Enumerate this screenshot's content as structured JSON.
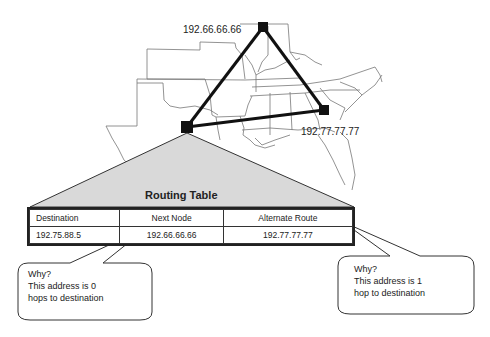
{
  "map": {
    "nodes": [
      {
        "id": "north",
        "label": "192.66.66.66"
      },
      {
        "id": "east",
        "label": "192.77.77.77"
      },
      {
        "id": "source",
        "label": ""
      }
    ]
  },
  "routing_table": {
    "title": "Routing Table",
    "headers": [
      "Destination",
      "Next Node",
      "Alternate Route"
    ],
    "rows": [
      [
        "192.75.88.5",
        "192.66.66.66",
        "192.77.77.77"
      ]
    ]
  },
  "callouts": {
    "left": {
      "line1": "Why?",
      "line2": "This address is 0",
      "line3": "hops to destination"
    },
    "right": {
      "line1": "Why?",
      "line2": "This address is 1",
      "line3": "hop to destination"
    }
  }
}
